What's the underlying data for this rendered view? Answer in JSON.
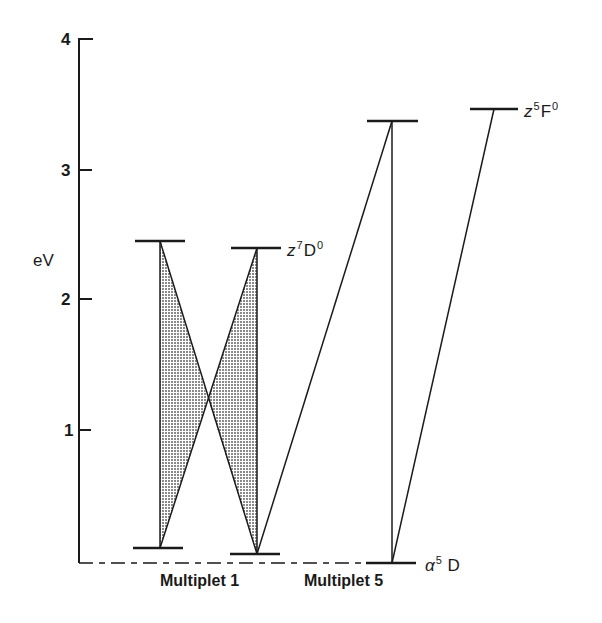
{
  "figure": {
    "axis": {
      "title": "eV",
      "ticks": [
        {
          "value": 4,
          "label": "4"
        },
        {
          "value": 3,
          "label": "3"
        },
        {
          "value": 2,
          "label": "2"
        },
        {
          "value": 1,
          "label": "1"
        }
      ],
      "range": [
        0,
        4
      ]
    },
    "groups": [
      {
        "label": "Multiplet 1"
      },
      {
        "label": "Multiplet 5"
      }
    ],
    "terms": {
      "z7D0": {
        "base": "z",
        "sup": "7",
        "letter": "D",
        "sup2": "0"
      },
      "z5F0": {
        "base": "z",
        "sup": "5",
        "letter": "F",
        "sup2": "0"
      },
      "a5D": {
        "base": "α",
        "sup": "5",
        "letter": " D"
      }
    },
    "levels": [
      {
        "id": "m1-upper-left",
        "group": "Multiplet 1",
        "energy_eV": 2.46
      },
      {
        "id": "m1-upper-right",
        "group": "Multiplet 1",
        "term": "z7D0",
        "energy_eV": 2.4
      },
      {
        "id": "m1-lower-left",
        "group": "Multiplet 1",
        "energy_eV": 0.11
      },
      {
        "id": "m1-lower-right",
        "group": "Multiplet 1",
        "energy_eV": 0.06
      },
      {
        "id": "m5-upper",
        "group": "Multiplet 5",
        "energy_eV": 3.37
      },
      {
        "id": "z5F0-level",
        "group": "Multiplet 5",
        "term": "z5F0",
        "energy_eV": 3.47
      },
      {
        "id": "a5D-level",
        "group": "Multiplet 5",
        "term": "a5D",
        "energy_eV": 0.0
      }
    ],
    "transitions": [
      {
        "from": "m1-lower-left",
        "to": "m1-upper-left",
        "shaded": true
      },
      {
        "from": "m1-lower-right",
        "to": "m1-upper-left",
        "shaded": true
      },
      {
        "from": "m1-lower-left",
        "to": "m1-upper-right",
        "shaded": true
      },
      {
        "from": "m1-lower-right",
        "to": "m1-upper-right",
        "shaded": true
      },
      {
        "from": "m1-lower-right",
        "to": "m5-upper",
        "shaded": false
      },
      {
        "from": "a5D-level",
        "to": "m5-upper",
        "shaded": false
      },
      {
        "from": "a5D-level",
        "to": "z5F0-level",
        "shaded": false
      }
    ],
    "colors": {
      "ink": "#1a1a1a",
      "shade": "#9a9a9a",
      "background": "#ffffff"
    }
  }
}
